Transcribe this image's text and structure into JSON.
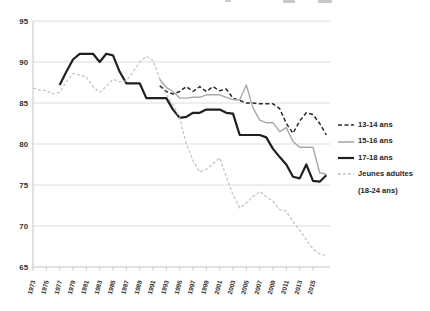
{
  "figure": {
    "background": "#ffffff",
    "grid_color": "#dcdcdc",
    "axis_color": "#c4c4c4",
    "tick_label_color": "#303030",
    "legend_text_color": "#262626"
  },
  "chart_data": {
    "type": "line",
    "title": "",
    "xlabel": "",
    "ylabel": "",
    "ylim": [
      65,
      95
    ],
    "xlim": [
      1973,
      2017.5
    ],
    "grid": "horizontal",
    "legend_position": "right",
    "y_ticks": [
      65,
      70,
      75,
      80,
      85,
      90,
      95
    ],
    "x_tick_labels": [
      "1973",
      "1975",
      "1977",
      "1979",
      "1981",
      "1983",
      "1985",
      "1987",
      "1989",
      "1991",
      "1993",
      "1995",
      "1997",
      "1999",
      "2001",
      "2003",
      "2005",
      "2007",
      "2009",
      "2011",
      "2013",
      "2015"
    ],
    "series": [
      {
        "name": "13-14 ans",
        "color": "#2a2a2a",
        "dash": "4 2.5",
        "width": 1.5,
        "x": [
          1992,
          1993,
          1994,
          1995,
          1996,
          1997,
          1998,
          1999,
          2000,
          2001,
          2002,
          2003,
          2004,
          2005,
          2006,
          2007,
          2008,
          2009,
          2010,
          2011,
          2012,
          2013,
          2014,
          2015,
          2016,
          2017
        ],
        "values": [
          87.1,
          86.4,
          86.1,
          86.4,
          87.0,
          86.4,
          87.0,
          86.4,
          87.0,
          86.5,
          86.7,
          85.6,
          85.3,
          85.0,
          85.0,
          84.9,
          84.9,
          84.9,
          84.3,
          82.5,
          81.3,
          82.8,
          83.8,
          83.6,
          82.5,
          81.1
        ]
      },
      {
        "name": "15-16 ans",
        "color": "#a8a8a8",
        "dash": "",
        "width": 1.4,
        "x": [
          1992,
          1993,
          1994,
          1995,
          1996,
          1997,
          1998,
          1999,
          2000,
          2001,
          2002,
          2003,
          2004,
          2005,
          2006,
          2007,
          2008,
          2009,
          2010,
          2011,
          2012,
          2013,
          2014,
          2015,
          2016,
          2017
        ],
        "values": [
          87.9,
          86.9,
          86.4,
          85.6,
          85.6,
          85.7,
          85.7,
          86.0,
          86.0,
          86.0,
          85.7,
          85.4,
          85.4,
          87.2,
          84.4,
          82.9,
          82.6,
          82.6,
          81.5,
          82.0,
          80.3,
          79.6,
          79.6,
          79.6,
          76.5,
          76.3
        ]
      },
      {
        "name": "17-18 ans",
        "color": "#1f1f1f",
        "dash": "",
        "width": 2.2,
        "x": [
          1977,
          1978,
          1979,
          1980,
          1981,
          1982,
          1983,
          1984,
          1985,
          1986,
          1987,
          1988,
          1989,
          1990,
          1991,
          1992,
          1993,
          1994,
          1995,
          1996,
          1997,
          1998,
          1999,
          2000,
          2001,
          2002,
          2003,
          2004,
          2005,
          2006,
          2007,
          2008,
          2009,
          2010,
          2011,
          2012,
          2013,
          2014,
          2015,
          2016,
          2017
        ],
        "values": [
          87.2,
          88.8,
          90.3,
          91.0,
          91.0,
          91.0,
          90.0,
          91.0,
          90.8,
          88.8,
          87.4,
          87.4,
          87.4,
          85.6,
          85.6,
          85.6,
          85.6,
          84.2,
          83.2,
          83.3,
          83.8,
          83.8,
          84.2,
          84.2,
          84.2,
          83.8,
          83.7,
          81.1,
          81.1,
          81.1,
          81.1,
          80.8,
          79.4,
          78.4,
          77.5,
          76.0,
          75.8,
          77.5,
          75.5,
          75.4,
          76.2
        ]
      },
      {
        "name": "Jeunes adultes (18-24 ans)",
        "color": "#c2c2c2",
        "dash": "3 2",
        "width": 1.2,
        "x": [
          1973,
          1974,
          1975,
          1976,
          1977,
          1978,
          1979,
          1980,
          1981,
          1982,
          1983,
          1984,
          1985,
          1986,
          1987,
          1988,
          1989,
          1990,
          1991,
          1992,
          1993,
          1994,
          1995,
          1996,
          1997,
          1998,
          1999,
          2000,
          2001,
          2002,
          2003,
          2004,
          2005,
          2006,
          2007,
          2008,
          2009,
          2010,
          2011,
          2012,
          2013,
          2014,
          2015,
          2016,
          2017
        ],
        "values": [
          86.8,
          86.6,
          86.5,
          86.1,
          86.3,
          87.6,
          88.6,
          88.4,
          88.2,
          87.0,
          86.3,
          87.0,
          87.9,
          87.6,
          87.7,
          88.8,
          90.0,
          90.7,
          90.2,
          88.0,
          86.0,
          84.8,
          83.2,
          80.0,
          78.0,
          76.6,
          76.9,
          77.6,
          78.3,
          76.0,
          73.8,
          72.2,
          72.8,
          73.6,
          74.2,
          73.6,
          73.0,
          72.0,
          71.8,
          70.5,
          69.5,
          68.3,
          67.2,
          66.6,
          66.4
        ]
      }
    ]
  },
  "legend": {
    "items": [
      {
        "label": "13-14 ans"
      },
      {
        "label": "15-16 ans"
      },
      {
        "label": "17-18 ans"
      },
      {
        "label": "Jeunes adultes",
        "label2": "(18-24 ans)"
      }
    ]
  }
}
